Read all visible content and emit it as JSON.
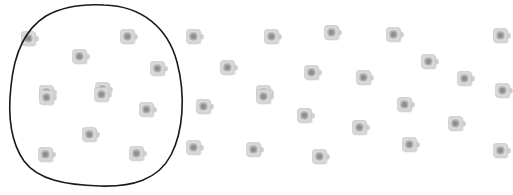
{
  "scene": {
    "title": "Lasso selection over scattered device icons",
    "background_color": "#ffffff",
    "width": 513,
    "height": 195
  },
  "icon": {
    "semantic_name": "device-icon",
    "description": "rounded square device with round lens and right-side tab",
    "body_fill": "#d9d9d9",
    "body_stroke": "#c4c4c4",
    "lens_outer": "#b0b0b0",
    "lens_inner": "#8f8f8f",
    "tab_fill": "#cfcfcf",
    "shadow_color": "#e4e4e4",
    "size": 22
  },
  "lasso": {
    "semantic_name": "lasso-selection-path",
    "stroke_color": "#1a1a1a",
    "stroke_width": 1.6,
    "fill": "none",
    "enclosed_count": 12,
    "path": "M 104 5 C 142 6 168 28 177 62 C 186 96 183 132 171 155 C 158 180 132 187 100 186 C 66 185 38 180 24 161 C 10 141 8 112 11 86 C 14 55 25 29 46 16 C 62 7 84 4 104 5 Z"
  },
  "icons": [
    {
      "id": "icon-1",
      "x": 30,
      "y": 39,
      "inside": true
    },
    {
      "id": "icon-2",
      "x": 81,
      "y": 57,
      "inside": true
    },
    {
      "id": "icon-3",
      "x": 129,
      "y": 37,
      "inside": true
    },
    {
      "id": "icon-4",
      "x": 159,
      "y": 69,
      "inside": true
    },
    {
      "id": "icon-5",
      "x": 48,
      "y": 93,
      "inside": true
    },
    {
      "id": "icon-6",
      "x": 104,
      "y": 90,
      "inside": true
    },
    {
      "id": "icon-7",
      "x": 48,
      "y": 98,
      "inside": true
    },
    {
      "id": "icon-8",
      "x": 148,
      "y": 110,
      "inside": true
    },
    {
      "id": "icon-9",
      "x": 91,
      "y": 135,
      "inside": true
    },
    {
      "id": "icon-10",
      "x": 47,
      "y": 155,
      "inside": true
    },
    {
      "id": "icon-11",
      "x": 138,
      "y": 154,
      "inside": true
    },
    {
      "id": "icon-12",
      "x": 103,
      "y": 95,
      "inside": true
    },
    {
      "id": "icon-13",
      "x": 195,
      "y": 37,
      "inside": false
    },
    {
      "id": "icon-14",
      "x": 273,
      "y": 37,
      "inside": false
    },
    {
      "id": "icon-15",
      "x": 333,
      "y": 33,
      "inside": false
    },
    {
      "id": "icon-16",
      "x": 395,
      "y": 35,
      "inside": false
    },
    {
      "id": "icon-17",
      "x": 502,
      "y": 36,
      "inside": false
    },
    {
      "id": "icon-18",
      "x": 229,
      "y": 68,
      "inside": false
    },
    {
      "id": "icon-19",
      "x": 313,
      "y": 73,
      "inside": false
    },
    {
      "id": "icon-20",
      "x": 430,
      "y": 62,
      "inside": false
    },
    {
      "id": "icon-21",
      "x": 365,
      "y": 78,
      "inside": false
    },
    {
      "id": "icon-22",
      "x": 466,
      "y": 79,
      "inside": false
    },
    {
      "id": "icon-23",
      "x": 265,
      "y": 93,
      "inside": false
    },
    {
      "id": "icon-24",
      "x": 504,
      "y": 91,
      "inside": false
    },
    {
      "id": "icon-25",
      "x": 205,
      "y": 107,
      "inside": false
    },
    {
      "id": "icon-26",
      "x": 265,
      "y": 97,
      "inside": false
    },
    {
      "id": "icon-27",
      "x": 306,
      "y": 116,
      "inside": false
    },
    {
      "id": "icon-28",
      "x": 406,
      "y": 105,
      "inside": false
    },
    {
      "id": "icon-29",
      "x": 361,
      "y": 128,
      "inside": false
    },
    {
      "id": "icon-30",
      "x": 457,
      "y": 124,
      "inside": false
    },
    {
      "id": "icon-31",
      "x": 195,
      "y": 148,
      "inside": false
    },
    {
      "id": "icon-32",
      "x": 255,
      "y": 150,
      "inside": false
    },
    {
      "id": "icon-33",
      "x": 321,
      "y": 157,
      "inside": false
    },
    {
      "id": "icon-34",
      "x": 411,
      "y": 145,
      "inside": false
    },
    {
      "id": "icon-35",
      "x": 502,
      "y": 151,
      "inside": false
    }
  ]
}
